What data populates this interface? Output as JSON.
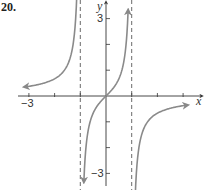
{
  "problem_number": "20.",
  "chart_data": {
    "type": "line",
    "title": "",
    "function_hint": "y = x / (1 - x^2)",
    "xlabel": "x",
    "ylabel": "y",
    "xlim": [
      -3.4,
      3.4
    ],
    "ylim": [
      -3.5,
      3.6
    ],
    "x_tick_labels": [
      "-3"
    ],
    "y_tick_labels": [
      "3",
      "-3"
    ],
    "x_ticks": [
      -3,
      -2,
      -1,
      1,
      2,
      3
    ],
    "y_ticks": [
      -3,
      -2,
      -1,
      1,
      2,
      3
    ],
    "vertical_asymptotes": [
      -1,
      1
    ],
    "horizontal_asymptote": 0,
    "grid": false,
    "series": [
      {
        "name": "left branch",
        "x": [
          -3.0,
          -2.5,
          -2.0,
          -1.5,
          -1.25,
          -1.1
        ],
        "y": [
          0.375,
          0.476,
          0.667,
          1.2,
          2.22,
          5.24
        ]
      },
      {
        "name": "middle branch",
        "x": [
          -0.9,
          -0.75,
          -0.5,
          -0.25,
          0,
          0.25,
          0.5,
          0.75,
          0.9
        ],
        "y": [
          -4.74,
          -1.71,
          -0.667,
          -0.267,
          0,
          0.267,
          0.667,
          1.71,
          4.74
        ]
      },
      {
        "name": "right branch",
        "x": [
          1.1,
          1.25,
          1.5,
          2.0,
          2.5,
          3.0
        ],
        "y": [
          -5.24,
          -2.22,
          -1.2,
          -0.667,
          -0.476,
          -0.375
        ]
      }
    ]
  },
  "labels": {
    "x_axis": "x",
    "y_axis": "y",
    "x_neg3": "−3",
    "y_pos3": "3",
    "y_neg3": "−3"
  }
}
